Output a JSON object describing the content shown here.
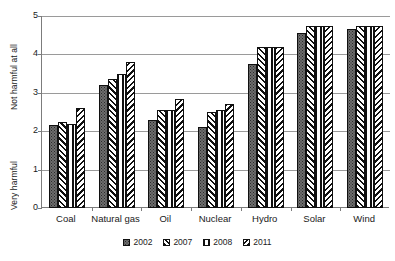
{
  "chart_data": {
    "type": "bar",
    "title": "",
    "xlabel": "",
    "ylabel": "",
    "ylim": [
      0,
      5
    ],
    "yticks": [
      0,
      1,
      2,
      3,
      4,
      5
    ],
    "ytick_labels": [
      "0",
      "1",
      "2",
      "3",
      "4",
      "5"
    ],
    "y_axis_low_label": "Very harmful",
    "y_axis_high_label": "Not harmful at all",
    "grid": "horizontal",
    "legend_position": "bottom",
    "categories": [
      "Coal",
      "Natural gas",
      "Oil",
      "Nuclear",
      "Hydro",
      "Solar",
      "Wind"
    ],
    "series": [
      {
        "name": "2002",
        "pattern": "solid-speckled",
        "color": "#6d6d6d",
        "values": [
          2.15,
          3.2,
          2.3,
          2.1,
          3.75,
          4.55,
          4.65
        ]
      },
      {
        "name": "2007",
        "pattern": "forward-diagonal-hatch",
        "color": "#ffffff",
        "values": [
          2.25,
          3.35,
          2.55,
          2.5,
          4.2,
          4.75,
          4.75
        ]
      },
      {
        "name": "2008",
        "pattern": "vertical-lines",
        "color": "#ffffff",
        "values": [
          2.2,
          3.5,
          2.55,
          2.55,
          4.2,
          4.75,
          4.75
        ]
      },
      {
        "name": "2011",
        "pattern": "backward-diagonal-hatch",
        "color": "#ffffff",
        "values": [
          2.6,
          3.8,
          2.85,
          2.7,
          4.2,
          4.75,
          4.75
        ]
      }
    ]
  },
  "axis": {
    "y_top_title": "Not harmful at all",
    "y_bottom_title": "Very harmful"
  },
  "colors": {
    "axis": "#7c7c7c",
    "gridline": "#9a9a9a",
    "bar_outline": "#101010",
    "series_2002_fill": "#6d6d6d",
    "text": "#1a1a1a",
    "background": "#ffffff"
  }
}
